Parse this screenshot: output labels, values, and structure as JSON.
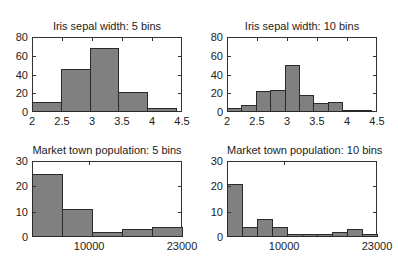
{
  "chart_data": [
    {
      "type": "bar",
      "title": "Iris sepal width: 5 bins",
      "xlabel": "",
      "ylabel": "",
      "bin_edges": [
        2.0,
        2.48,
        2.96,
        3.44,
        3.92,
        4.4
      ],
      "values": [
        11,
        46,
        68,
        21,
        4
      ],
      "xlim": [
        2,
        4.5
      ],
      "ylim": [
        0,
        80
      ],
      "xticks": [
        2,
        2.5,
        3,
        3.5,
        4,
        4.5
      ],
      "xtick_labels": [
        "2",
        "2.5",
        "3",
        "3.5",
        "4",
        "4.5"
      ],
      "yticks": [
        0,
        20,
        40,
        60,
        80
      ],
      "ytick_labels": [
        "0",
        "20",
        "40",
        "60",
        "80"
      ],
      "grid": false
    },
    {
      "type": "bar",
      "title": "Iris sepal width: 10 bins",
      "xlabel": "",
      "ylabel": "",
      "bin_edges": [
        2.0,
        2.24,
        2.48,
        2.72,
        2.96,
        3.2,
        3.44,
        3.68,
        3.92,
        4.16,
        4.4
      ],
      "values": [
        4,
        7,
        22,
        24,
        50,
        18,
        10,
        11,
        2,
        2
      ],
      "xlim": [
        2,
        4.5
      ],
      "ylim": [
        0,
        80
      ],
      "xticks": [
        2,
        2.5,
        3,
        3.5,
        4,
        4.5
      ],
      "xtick_labels": [
        "2",
        "2.5",
        "3",
        "3.5",
        "4",
        "4.5"
      ],
      "yticks": [
        0,
        20,
        40,
        60,
        80
      ],
      "ytick_labels": [
        "0",
        "20",
        "40",
        "60",
        "80"
      ],
      "grid": false
    },
    {
      "type": "bar",
      "title": "Market town population: 5 bins",
      "xlabel": "",
      "ylabel": "",
      "bin_edges": [
        2000,
        6200,
        10400,
        14600,
        18800,
        23000
      ],
      "values": [
        25,
        11,
        2,
        3,
        4
      ],
      "xlim": [
        2000,
        23000
      ],
      "ylim": [
        0,
        30
      ],
      "xticks": [
        10000,
        23000
      ],
      "xtick_labels": [
        "10000",
        "23000"
      ],
      "yticks": [
        0,
        10,
        20,
        30
      ],
      "ytick_labels": [
        "0",
        "10",
        "20",
        "30"
      ],
      "grid": false
    },
    {
      "type": "bar",
      "title": "Market town population: 10 bins",
      "xlabel": "",
      "ylabel": "",
      "bin_edges": [
        2000,
        4100,
        6200,
        8300,
        10400,
        12500,
        14600,
        16700,
        18800,
        20900,
        23000
      ],
      "values": [
        21,
        4,
        7,
        4,
        1,
        1,
        1,
        2,
        3,
        1
      ],
      "xlim": [
        2000,
        23000
      ],
      "ylim": [
        0,
        30
      ],
      "xticks": [
        10000,
        23000
      ],
      "xtick_labels": [
        "10000",
        "23000"
      ],
      "yticks": [
        0,
        10,
        20,
        30
      ],
      "ytick_labels": [
        "0",
        "10",
        "20",
        "30"
      ],
      "grid": false
    }
  ],
  "layout": {
    "panels": [
      {
        "left": 32,
        "top": 37,
        "width": 150,
        "height": 75
      },
      {
        "left": 227,
        "top": 37,
        "width": 150,
        "height": 75
      },
      {
        "left": 32,
        "top": 161,
        "width": 150,
        "height": 76
      },
      {
        "left": 227,
        "top": 161,
        "width": 150,
        "height": 76
      }
    ]
  },
  "colors": {
    "bar_fill": "#808080",
    "bar_edge": "#2a2a2a",
    "axis": "#333333",
    "text": "#222222"
  }
}
